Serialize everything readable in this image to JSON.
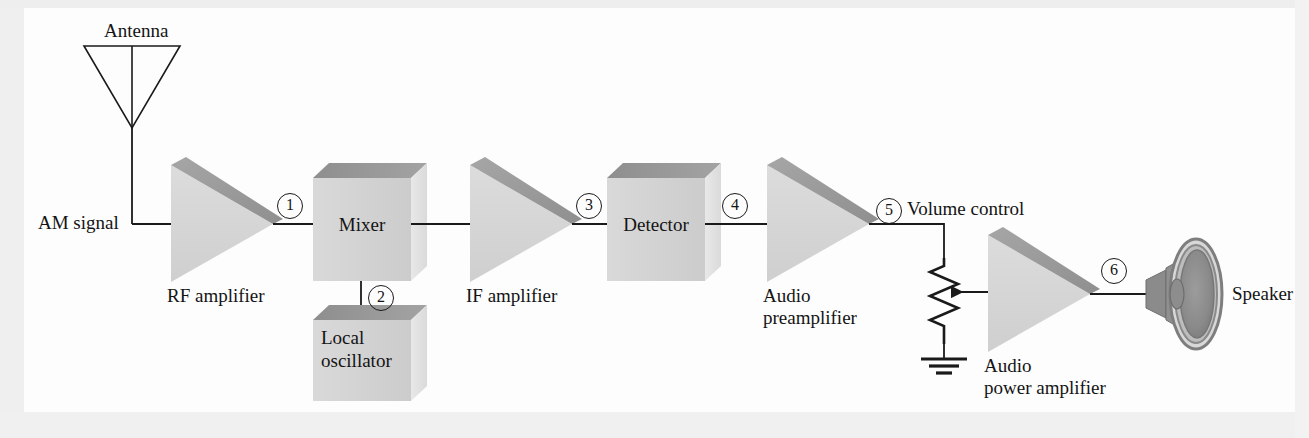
{
  "figure": {
    "background_color": "#fdfdfd",
    "line_color": "#1a1a1a",
    "block_face_color": "#d2d2d2",
    "block_top_color": "#9a9a9a",
    "block_side_color": "#e3e3e3",
    "triangle_face_color": "#d5d5d5",
    "triangle_bevel_color": "#9c9c9c"
  },
  "labels": {
    "antenna": "Antenna",
    "am_signal": "AM signal",
    "rf_amplifier": "RF amplifier",
    "mixer": "Mixer",
    "local_oscillator_line1": "Local",
    "local_oscillator_line2": "oscillator",
    "if_amplifier": "IF amplifier",
    "detector": "Detector",
    "audio_preamplifier_line1": "Audio",
    "audio_preamplifier_line2": "preamplifier",
    "volume_control": "Volume control",
    "audio_power_amplifier_line1": "Audio",
    "audio_power_amplifier_line2": "power amplifier",
    "speaker": "Speaker"
  },
  "callouts": [
    {
      "id": 1,
      "text": "1",
      "at": "RF amplifier output to Mixer input"
    },
    {
      "id": 2,
      "text": "2",
      "at": "Local oscillator output to Mixer"
    },
    {
      "id": 3,
      "text": "3",
      "at": "IF amplifier output to Detector input"
    },
    {
      "id": 4,
      "text": "4",
      "at": "Detector output to Audio preamplifier input"
    },
    {
      "id": 5,
      "text": "5",
      "at": "Audio preamplifier output to Volume control"
    },
    {
      "id": 6,
      "text": "6",
      "at": "Audio power amplifier output to Speaker"
    }
  ],
  "stages": [
    {
      "key": "antenna",
      "label": "Antenna",
      "shape": "antenna-triangle"
    },
    {
      "key": "rf_amplifier",
      "label": "RF amplifier",
      "shape": "amplifier-triangle"
    },
    {
      "key": "mixer",
      "label": "Mixer",
      "shape": "cube"
    },
    {
      "key": "local_oscillator",
      "label": "Local oscillator",
      "shape": "cube"
    },
    {
      "key": "if_amplifier",
      "label": "IF amplifier",
      "shape": "amplifier-triangle"
    },
    {
      "key": "detector",
      "label": "Detector",
      "shape": "cube"
    },
    {
      "key": "audio_preamplifier",
      "label": "Audio preamplifier",
      "shape": "amplifier-triangle"
    },
    {
      "key": "volume_control",
      "label": "Volume control",
      "shape": "potentiometer"
    },
    {
      "key": "audio_power_amplifier",
      "label": "Audio power amplifier",
      "shape": "amplifier-triangle"
    },
    {
      "key": "speaker",
      "label": "Speaker",
      "shape": "speaker-cone"
    }
  ]
}
